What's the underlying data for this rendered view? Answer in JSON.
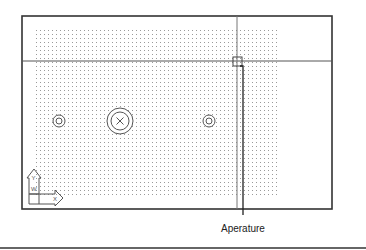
{
  "figure": {
    "callout_label": "Aperature",
    "ucs_icon": {
      "x_label": "X",
      "y_label": "Y",
      "w_label": "W"
    }
  },
  "colors": {
    "frame": "#333333",
    "crosshair": "#555555",
    "grid_dot": "#9a9a9a",
    "circle": "#555555",
    "text": "#222222"
  },
  "drawing": {
    "frame": {
      "x": 22,
      "y": 16,
      "w": 310,
      "h": 193
    },
    "crosshair": {
      "x": 237,
      "y": 61
    },
    "aperture_box": {
      "x": 233,
      "y": 57,
      "size": 9
    },
    "grid": {
      "x0": 36,
      "y0": 30,
      "x1": 278,
      "y1": 196,
      "spacing": 4
    },
    "circles": [
      {
        "name": "small-circle-left",
        "cx": 59,
        "cy": 121,
        "r_outer": 6,
        "r_inner": 3
      },
      {
        "name": "large-circle-center",
        "cx": 120,
        "cy": 121,
        "r_outer": 13,
        "r_inner": 9,
        "cross": true
      },
      {
        "name": "small-circle-right",
        "cx": 209,
        "cy": 121,
        "r_outer": 6,
        "r_inner": 3
      }
    ]
  }
}
